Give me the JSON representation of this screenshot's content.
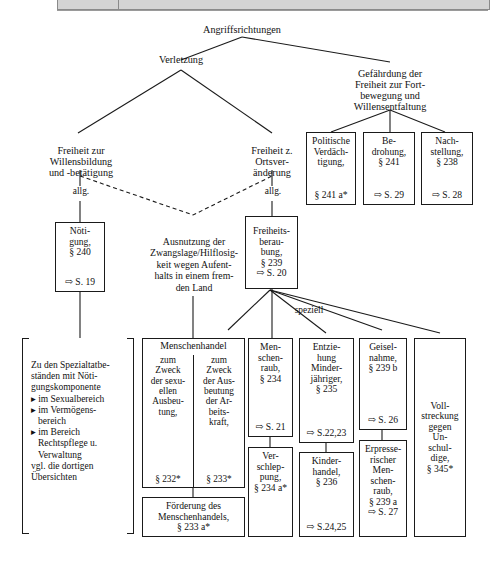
{
  "toolbar": {
    "present": true
  },
  "diagram": {
    "root": {
      "label": "Angriffsrichtungen"
    },
    "level1": [
      {
        "label": "Verletzung"
      },
      {
        "label": "Gefährdung der\nFreiheit zur Fort-\nbewegung und\nWillensentfaltung"
      }
    ],
    "level2": [
      {
        "label": "Freiheit zur\nWillensbildung\nund -betätigung"
      },
      {
        "label": "Freiheit z.\nOrtsver-\nänderung"
      }
    ],
    "edge_labels": {
      "allg_left": "allg.",
      "allg_right": "allg.",
      "speziell": "speziell"
    },
    "gefaehrdung_boxes": [
      {
        "name": "politische-verdaechtigung",
        "lines": [
          "Politische",
          "Verdäch-",
          "tigung,",
          "§ 241 a*"
        ],
        "ref": ""
      },
      {
        "name": "bedrohung",
        "lines": [
          "Be-",
          "drohung,",
          "§ 241"
        ],
        "ref": "⇨ S. 29"
      },
      {
        "name": "nachstellung",
        "lines": [
          "Nach-",
          "stellung,",
          "§ 238"
        ],
        "ref": "⇨ S. 28"
      }
    ],
    "noetigung_box": {
      "lines": [
        "Nöti-",
        "gung,",
        "§ 240"
      ],
      "ref": "⇨ S. 19"
    },
    "ausnutzung_text": "Ausnutzung der\nZwangslage/Hilflosig-\nkeit wegen Aufent-\nhalts in einem frem-\nden Land",
    "freiheitsberaubung_box": {
      "lines": [
        "Freiheits-",
        "berau-",
        "bung,",
        "§ 239"
      ],
      "ref": "⇨ S. 20"
    },
    "bracket_panel": {
      "intro": "Zu den Spezialtatbe-\nständen mit Nöti-\ngungskomponente",
      "bullets": [
        "▸ im Sexualbereich",
        "▸ im Vermögens-\n   bereich",
        "▸ im Bereich\n   Rechtspflege u.\n   Verwaltung"
      ],
      "outro": "vgl. die dortigen\nÜbersichten"
    },
    "menschenhandel": {
      "title": "Menschenhandel",
      "col_left": {
        "lines": [
          "zum",
          "Zweck",
          "der sexu-",
          "ellen",
          "Ausbeu-",
          "tung,"
        ],
        "ref": "§ 232*"
      },
      "col_right": {
        "lines": [
          "zum",
          "Zweck",
          "der Aus-",
          "beutung",
          "der Ar-",
          "beits-",
          "kraft,"
        ],
        "ref": "§ 233*"
      },
      "footer": "Förderung des\nMenschenhandels,\n§ 233 a*"
    },
    "speziell_columns": [
      {
        "name": "menschenraub",
        "top": {
          "lines": [
            "Men-",
            "schen-",
            "raub,",
            "§ 234"
          ],
          "ref": "⇨ S. 21"
        },
        "bottom": {
          "lines": [
            "Ver-",
            "schlep-",
            "pung,",
            "§ 234 a*"
          ],
          "ref": ""
        }
      },
      {
        "name": "entziehung-minderjaehriger",
        "top": {
          "lines": [
            "Entzie-",
            "hung",
            "Minder-",
            "jähriger,",
            "§ 235"
          ],
          "ref": "⇨ S.22,23"
        },
        "bottom": {
          "lines": [
            "Kinder-",
            "handel,",
            "§ 236"
          ],
          "ref": "⇨ S.24,25"
        }
      },
      {
        "name": "geiselnahme",
        "top": {
          "lines": [
            "Geisel-",
            "nahme,",
            "§ 239 b"
          ],
          "ref": "⇨ S. 26"
        },
        "bottom": {
          "lines": [
            "Erpresse-",
            "rischer",
            "Men-",
            "schen-",
            "raub,",
            "§ 239 a"
          ],
          "ref": "⇨ S. 27"
        }
      }
    ],
    "vollstreckung_box": {
      "lines": [
        "Voll-",
        "streckung",
        "gegen",
        "Un-",
        "schul-",
        "dige,",
        "§ 345*"
      ]
    }
  }
}
